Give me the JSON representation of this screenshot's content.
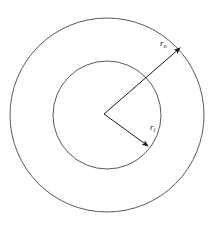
{
  "figure": {
    "name": "annulus-radii-diagram",
    "background_color": "#ffffff",
    "width": 220,
    "height": 230,
    "center": {
      "x": 107,
      "y": 115
    }
  },
  "shapes": {
    "outer_circle": {
      "label": "outer-circle",
      "center_x": 107,
      "center_y": 115,
      "radius": 97,
      "stroke_color": "#5a5a5a",
      "stroke_width": 1,
      "fill": "none"
    },
    "inner_circle": {
      "label": "inner-circle",
      "center_x": 107,
      "center_y": 115,
      "radius": 54,
      "stroke_color": "#5a5a5a",
      "stroke_width": 1,
      "fill": "none"
    }
  },
  "annotations": {
    "outer_radius": {
      "symbol": "r",
      "subscript": "o",
      "label_x": 160,
      "label_y": 46,
      "arrow_from_x": 104,
      "arrow_from_y": 114,
      "arrow_to_x": 180,
      "arrow_to_y": 48,
      "color": "#1a1a1a"
    },
    "inner_radius": {
      "symbol": "r",
      "subscript": "i",
      "label_x": 150,
      "label_y": 130,
      "arrow_from_x": 104,
      "arrow_from_y": 114,
      "arrow_to_x": 148,
      "arrow_to_y": 146,
      "color": "#1a1a1a"
    }
  },
  "chart_data": {
    "type": "diagram",
    "title": "",
    "subtitle": "",
    "series": [
      {
        "name": "outer-circle",
        "shape": "circle",
        "center": [
          107,
          115
        ],
        "radius": 97
      },
      {
        "name": "inner-circle",
        "shape": "circle",
        "center": [
          107,
          115
        ],
        "radius": 54
      }
    ],
    "annotations": [
      {
        "text": "r_o",
        "shape": "arrow",
        "from": [
          104,
          114
        ],
        "to": [
          180,
          48
        ]
      },
      {
        "text": "r_i",
        "shape": "arrow",
        "from": [
          104,
          114
        ],
        "to": [
          148,
          146
        ]
      }
    ],
    "xlabel": "",
    "ylabel": "",
    "grid": false,
    "legend": false
  }
}
